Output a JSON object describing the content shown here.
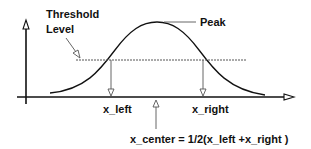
{
  "diagram": {
    "title": "",
    "labels": {
      "threshold_line1": "Threshold",
      "threshold_line2": "Level",
      "peak": "Peak",
      "x_left": "x_left",
      "x_right": "x_right",
      "x_center_formula": "x_center = 1/2(x_left +x_right )"
    },
    "elements": {
      "y_axis": "vertical axis with hollow arrowhead",
      "x_axis": "horizontal axis with hollow arrowhead",
      "curve": "bell-shaped peak curve",
      "threshold_line": "horizontal dotted threshold level line",
      "x_left_marker": "vertical drop line with hollow arrow at left crossing",
      "x_right_marker": "vertical drop line with hollow arrow at right crossing",
      "x_center_marker": "upward hollow arrow indicating center"
    },
    "colors": {
      "line": "#111111",
      "thin_line": "#555555",
      "background": "#ffffff"
    }
  }
}
